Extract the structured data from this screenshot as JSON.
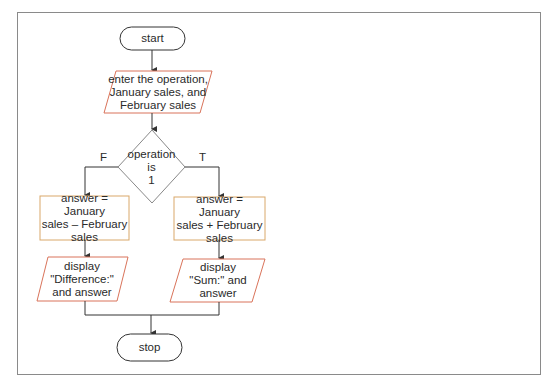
{
  "flowchart": {
    "colors": {
      "frame": "#8a8a8a",
      "process_border": "#d9a86a",
      "io_border": "#d9735a",
      "terminator_border": "#333333",
      "line": "#333333"
    },
    "start": {
      "label": "start"
    },
    "input": {
      "label": "enter the operation,\nJanuary sales, and\nFebruary sales"
    },
    "decision": {
      "label": "operation\nis\n1",
      "false_label": "F",
      "true_label": "T"
    },
    "false_branch": {
      "process": {
        "label": "answer = January\nsales – February\nsales"
      },
      "output": {
        "label": "display\n\"Difference:\"\nand answer"
      }
    },
    "true_branch": {
      "process": {
        "label": "answer = January\nsales + February\nsales"
      },
      "output": {
        "label": "display\n\"Sum:\" and\nanswer"
      }
    },
    "stop": {
      "label": "stop"
    }
  }
}
